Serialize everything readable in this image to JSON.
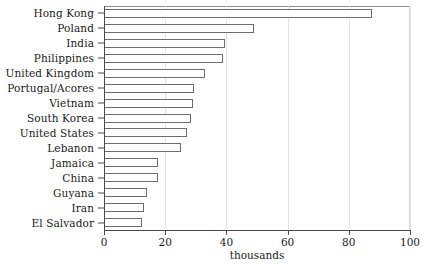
{
  "chart_data": {
    "type": "bar",
    "orientation": "horizontal",
    "title": "",
    "xlabel": "thousands",
    "ylabel": "",
    "xlim": [
      0,
      100
    ],
    "xticks": [
      0,
      20,
      40,
      60,
      80,
      100
    ],
    "xtick_labels": [
      "0",
      "20",
      "40",
      "60",
      "80",
      "100"
    ],
    "grid": "vertical",
    "legend": "none",
    "bar_fill_color": "#ffffff",
    "bar_edge_color": "#6d6d6d",
    "axis_color": "#4a4a4a",
    "categories": [
      "Hong Kong",
      "Poland",
      "India",
      "Philippines",
      "United Kingdom",
      "Portugal/Acores",
      "Vietnam",
      "South Korea",
      "United States",
      "Lebanon",
      "Jamaica",
      "China",
      "Guyana",
      "Iran",
      "El Salvador"
    ],
    "values": [
      87.5,
      49.0,
      39.5,
      39.0,
      33.0,
      29.5,
      29.0,
      28.5,
      27.0,
      25.0,
      17.5,
      17.5,
      14.0,
      13.0,
      12.5
    ]
  }
}
